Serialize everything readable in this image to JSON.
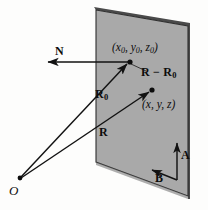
{
  "figure": {
    "colors": {
      "plane_fill": "#a9a9a9",
      "plane_edge": "#2b2b2b",
      "plane_shadow": "#5d5d5d",
      "stroke": "#121212",
      "background": "#fdfdfc"
    },
    "plane": {
      "name": "shaded-plane",
      "vertices": "96,10 188,26 188,196 96,162"
    },
    "labels": {
      "normal_vector": "N",
      "point_p0": "(x₀, y₀, z₀)",
      "p0_x": "x",
      "p0_sub": "0",
      "p0_y": "y",
      "p0_z": "z",
      "difference_vector_main": "R",
      "difference_vector_minus": "−",
      "difference_vector_second": "R",
      "difference_vector_sub": "0",
      "point_p": "(x, y, z)",
      "vector_r0": "R",
      "vector_r0_sub": "0",
      "vector_r": "R",
      "origin": "O",
      "basis_a": "A",
      "basis_b": "B"
    },
    "points": {
      "origin_coord": "(20, 178)",
      "p0_coord": "(130, 62)",
      "p_coord": "(152, 90)"
    }
  }
}
